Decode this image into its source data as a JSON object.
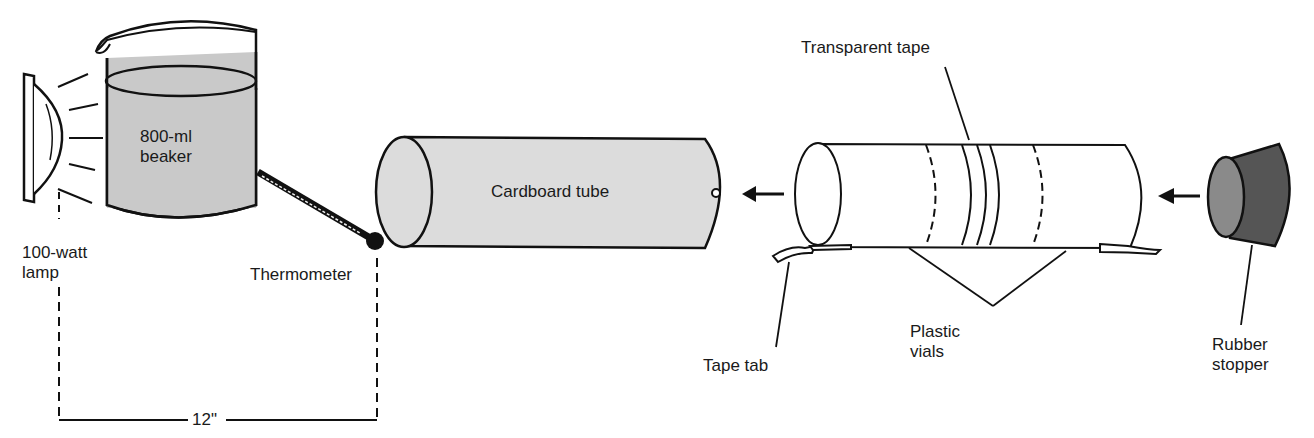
{
  "diagram": {
    "labels": {
      "beaker_line1": "800-ml",
      "beaker_line2": "beaker",
      "lamp_line1": "100-watt",
      "lamp_line2": "lamp",
      "thermometer": "Thermometer",
      "distance": "12\"",
      "cardboard_tube": "Cardboard tube",
      "transparent_tape": "Transparent tape",
      "tape_tab": "Tape tab",
      "plastic_vials_line1": "Plastic",
      "plastic_vials_line2": "vials",
      "rubber_stopper_line1": "Rubber",
      "rubber_stopper_line2": "stopper"
    },
    "colors": {
      "water_fill": "#c9c9c9",
      "tube_fill": "#dcdcdc",
      "stopper_dark": "#555555",
      "stopper_face": "#8a8a8a",
      "line": "#111111"
    }
  }
}
